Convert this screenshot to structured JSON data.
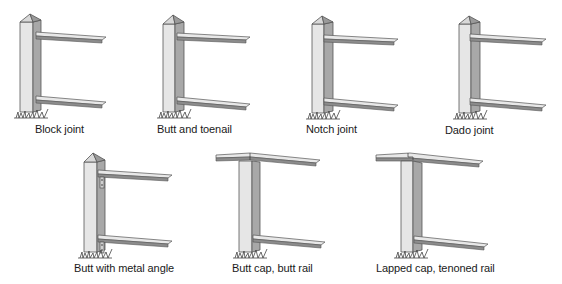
{
  "figures": [
    {
      "id": "block-joint",
      "label": "Block joint",
      "style": "post-two-rails"
    },
    {
      "id": "butt-and-toenail",
      "label": "Butt and toenail",
      "style": "post-two-rails"
    },
    {
      "id": "notch-joint",
      "label": "Notch joint",
      "style": "post-two-rails"
    },
    {
      "id": "dado-joint",
      "label": "Dado joint",
      "style": "post-two-rails"
    },
    {
      "id": "butt-with-metal-angle",
      "label": "Butt with metal angle",
      "style": "post-two-rails-brackets"
    },
    {
      "id": "butt-cap-butt-rail",
      "label": "Butt cap, butt rail",
      "style": "cap-rail"
    },
    {
      "id": "lapped-cap-tenoned-rail",
      "label": "Lapped cap, tenoned rail",
      "style": "cap-rail"
    }
  ],
  "colors": {
    "post_front": "#e4e4e4",
    "post_side": "#a9a9a9",
    "rail_top": "#e8e8e8",
    "rail_edge": "#8a8a8a",
    "outline": "#555555",
    "grass": "#444444"
  }
}
